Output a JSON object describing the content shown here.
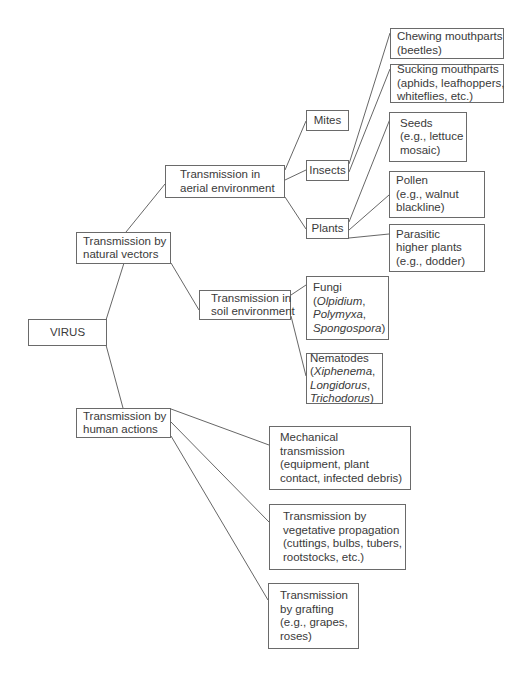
{
  "diagram": {
    "nodes": {
      "virus": {
        "lines": [
          "VIRUS"
        ]
      },
      "natural": {
        "lines": [
          "Transmission by",
          "natural vectors"
        ]
      },
      "human": {
        "lines": [
          "Transmission by",
          "human actions"
        ]
      },
      "aerial": {
        "lines": [
          "Transmission in",
          "aerial environment"
        ]
      },
      "soil": {
        "lines": [
          "Transmission in",
          "soil environment"
        ]
      },
      "mites": {
        "lines": [
          "Mites"
        ]
      },
      "insects": {
        "lines": [
          "Insects"
        ]
      },
      "plants": {
        "lines": [
          "Plants"
        ]
      },
      "chewing": {
        "lines": [
          "Chewing mouthparts",
          "(beetles)"
        ]
      },
      "sucking": {
        "lines": [
          "Sucking mouthparts",
          "(aphids, leafhoppers,",
          "whiteflies, etc.)"
        ]
      },
      "seeds": {
        "lines": [
          "Seeds",
          "(e.g., lettuce",
          "mosaic)"
        ]
      },
      "pollen": {
        "lines": [
          "Pollen",
          "(e.g., walnut",
          "blackline)"
        ]
      },
      "parasitic": {
        "lines": [
          "Parasitic",
          "higher plants",
          "(e.g., dodder)"
        ]
      },
      "fungi": {
        "title": "Fungi",
        "open": "(",
        "genus1": "Olpidium",
        "sep1": ",",
        "genus2": "Polymyxa",
        "sep2": ",",
        "genus3": "Spongospora",
        "close": ")"
      },
      "nematodes": {
        "title": "Nematodes",
        "open": "(",
        "genus1": "Xiphenema",
        "sep1": ",",
        "genus2": "Longidorus",
        "sep2": ",",
        "genus3": "Trichodorus",
        "close": ")"
      },
      "mechanical": {
        "lines": [
          "Mechanical",
          "transmission",
          "(equipment, plant",
          "contact, infected debris)"
        ]
      },
      "vegetative": {
        "lines": [
          "Transmission by",
          "vegetative propagation",
          "(cuttings, bulbs, tubers,",
          "rootstocks, etc.)"
        ]
      },
      "grafting": {
        "lines": [
          "Transmission",
          "by grafting",
          "(e.g., grapes,",
          "roses)"
        ]
      }
    },
    "edges": [
      [
        "virus",
        "natural"
      ],
      [
        "virus",
        "human"
      ],
      [
        "natural",
        "aerial"
      ],
      [
        "natural",
        "soil"
      ],
      [
        "aerial",
        "mites"
      ],
      [
        "aerial",
        "insects"
      ],
      [
        "aerial",
        "plants"
      ],
      [
        "insects",
        "chewing"
      ],
      [
        "insects",
        "sucking"
      ],
      [
        "plants",
        "seeds"
      ],
      [
        "plants",
        "pollen"
      ],
      [
        "plants",
        "parasitic"
      ],
      [
        "soil",
        "fungi"
      ],
      [
        "soil",
        "nematodes"
      ],
      [
        "human",
        "mechanical"
      ],
      [
        "human",
        "vegetative"
      ],
      [
        "human",
        "grafting"
      ]
    ]
  }
}
